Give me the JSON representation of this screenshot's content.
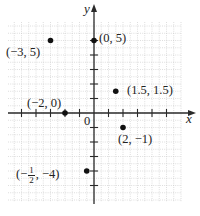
{
  "chart_data": {
    "type": "scatter",
    "title": "",
    "xlabel": "x",
    "ylabel": "y",
    "origin_label": "0",
    "xlim": [
      -6,
      6
    ],
    "ylim": [
      -6,
      6
    ],
    "grid": true,
    "legend": null,
    "points": [
      {
        "x": -3,
        "y": 5,
        "label": "(−3, 5)"
      },
      {
        "x": 0,
        "y": 5,
        "label": "(0, 5)"
      },
      {
        "x": 1.5,
        "y": 1.5,
        "label": "(1.5, 1.5)"
      },
      {
        "x": -2,
        "y": 0,
        "label": "(−2, 0)"
      },
      {
        "x": 2,
        "y": -1,
        "label": "(2, −1)"
      },
      {
        "x": -0.5,
        "y": -4,
        "label": "(−1/2, −4)"
      }
    ],
    "x_ticks": [
      -5,
      -4,
      -3,
      -2,
      -1,
      1,
      2,
      3,
      4,
      5
    ],
    "y_ticks": [
      -5,
      -4,
      -3,
      -2,
      -1,
      1,
      2,
      3,
      4,
      5
    ]
  },
  "labels": {
    "x_axis": "x",
    "y_axis": "y",
    "origin": "0",
    "p1": "(−3, 5)",
    "p2": "(0, 5)",
    "p3": "(1.5, 1.5)",
    "p4": "(−2, 0)",
    "p5": "(2, −1)",
    "p6_open": "(−",
    "p6_num": "1",
    "p6_den": "2",
    "p6_close": ", −4)"
  },
  "colors": {
    "axis": "#2a2a2a",
    "grid": "#c8c8c8",
    "point": "#111111"
  }
}
